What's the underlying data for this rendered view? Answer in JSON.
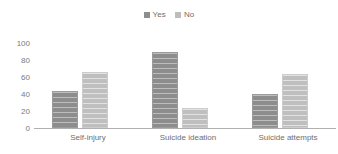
{
  "chart_data": {
    "type": "bar",
    "title": "",
    "subtitle": "",
    "xlabel": "",
    "ylabel": "",
    "ylim": [
      0,
      100
    ],
    "yticks": [
      "0",
      "20",
      "40",
      "60",
      "80",
      "100"
    ],
    "grid": false,
    "legend_position": "top-center",
    "categories": [
      "Self-injury",
      "Suicide ideation",
      "Suicide attempts"
    ],
    "series": [
      {
        "name": "Yes",
        "color": "#8d8d8d",
        "values": [
          44,
          89,
          40
        ]
      },
      {
        "name": "No",
        "color": "#bfbfbf",
        "values": [
          66,
          23,
          64
        ]
      }
    ]
  },
  "legend": {
    "items": [
      {
        "label": "Yes",
        "swatch": "legend-swatch-yes"
      },
      {
        "label": "No",
        "swatch": "legend-swatch-no"
      }
    ]
  },
  "axis": {
    "y_ticks": [
      {
        "label": "100"
      },
      {
        "label": "80"
      },
      {
        "label": "60"
      },
      {
        "label": "40"
      },
      {
        "label": "20"
      },
      {
        "label": "0"
      }
    ],
    "x_ticks": [
      {
        "label": "Self-injury"
      },
      {
        "label": "Suicide ideation"
      },
      {
        "label": "Suicide attempts"
      }
    ]
  },
  "colors": {
    "yes": "#8d8d8d",
    "no": "#bfbfbf",
    "axis": "#b0b0b0",
    "text": "#6e6e6e",
    "background": "#ffffff"
  }
}
